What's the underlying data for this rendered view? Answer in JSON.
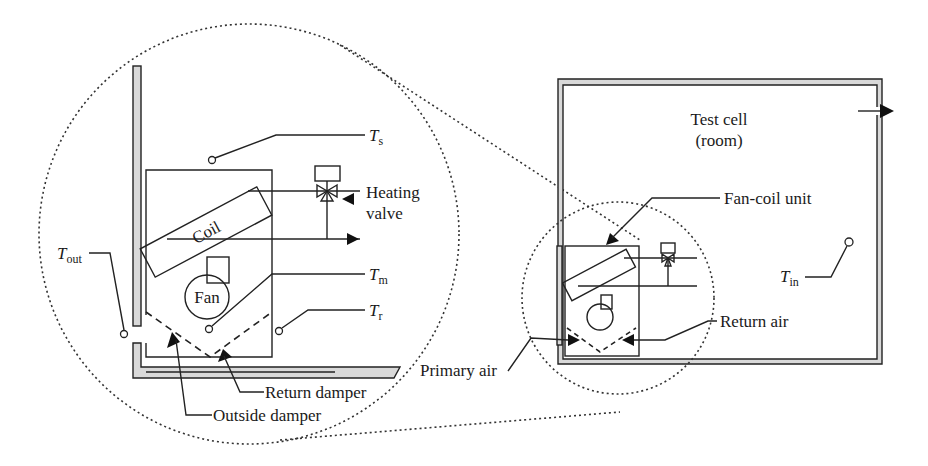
{
  "diagram": {
    "type": "schematic",
    "zoom_view": {
      "components": {
        "coil": "Coil",
        "fan": "Fan",
        "heating_valve_line1": "Heating",
        "heating_valve_line2": "valve",
        "return_damper": "Return damper",
        "outside_damper": "Outside damper"
      },
      "sensors": {
        "supply": {
          "main": "T",
          "sub": "s"
        },
        "mixed": {
          "main": "T",
          "sub": "m"
        },
        "return": {
          "main": "T",
          "sub": "r"
        },
        "outside": {
          "main": "T",
          "sub": "out"
        }
      }
    },
    "room_view": {
      "room_line1": "Test cell",
      "room_line2": "(room)",
      "fan_coil_unit": "Fan-coil unit",
      "return_air": "Return air",
      "primary_air": "Primary air",
      "indoor_sensor": {
        "main": "T",
        "sub": "in"
      }
    },
    "colors": {
      "line": "#222222",
      "wall_fill": "#d9d9d9",
      "background": "#ffffff"
    }
  }
}
